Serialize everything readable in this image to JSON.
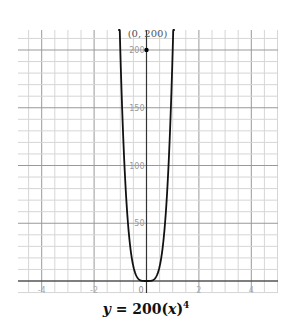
{
  "chart_data": {
    "type": "line",
    "equation": "y = 200(x)^4",
    "xlabel": "",
    "ylabel": "",
    "xlim": [
      -5,
      5
    ],
    "ylim": [
      -10,
      210
    ],
    "x_ticks": [
      -4,
      -2,
      0,
      2,
      4
    ],
    "y_ticks": [
      50,
      100,
      150,
      200
    ],
    "grid": true,
    "series": [
      {
        "name": "y = 200x^4",
        "x": [
          -1.04,
          -1.0,
          -0.9,
          -0.8,
          -0.7,
          -0.6,
          -0.5,
          -0.4,
          -0.3,
          -0.2,
          -0.1,
          0,
          0.1,
          0.2,
          0.3,
          0.4,
          0.5,
          0.6,
          0.7,
          0.8,
          0.9,
          1.0,
          1.04
        ],
        "values": [
          233.97,
          200,
          131.22,
          81.92,
          48.02,
          25.92,
          12.5,
          5.12,
          1.62,
          0.32,
          0.02,
          0,
          0.02,
          0.32,
          1.62,
          5.12,
          12.5,
          25.92,
          48.02,
          81.92,
          131.22,
          200,
          233.97
        ]
      }
    ],
    "annotations": [
      {
        "point": [
          0,
          200
        ],
        "label": "(0, 200)"
      }
    ]
  },
  "labels": {
    "point": "(0, 200)",
    "origin": "0",
    "caption_y": "y",
    "caption_eq": " = 200(",
    "caption_x": "x",
    "caption_close": ")",
    "caption_exp": "4"
  }
}
